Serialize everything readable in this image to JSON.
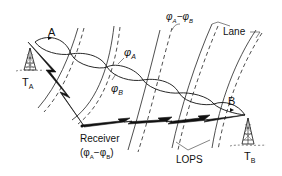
{
  "diagram": {
    "labels": {
      "wave_a": "A",
      "wave_b": "B",
      "phi_a": "φ",
      "phi_a_sub": "A",
      "phi_b": "φ",
      "phi_b_sub": "B",
      "diff_phi_a": "φ",
      "diff_sub_a": "A",
      "diff_minus": "−",
      "diff_phi_b": "φ",
      "diff_sub_b": "B",
      "lane": "Lane",
      "receiver": "Receiver",
      "receiver_formula_open": "(φ",
      "receiver_formula_sub_a": "A",
      "receiver_formula_mid": "−φ",
      "receiver_formula_sub_b": "B",
      "receiver_formula_close": ")",
      "lops": "LOPS",
      "transmitter_a": "T",
      "transmitter_a_sub": "A",
      "transmitter_b": "T",
      "transmitter_b_sub": "B"
    },
    "elements": {
      "transmitters": [
        "T_A",
        "T_B"
      ],
      "receiver": "Receiver (φA − φB)",
      "lop_pairs": 5,
      "wave_nodes": 6
    }
  }
}
